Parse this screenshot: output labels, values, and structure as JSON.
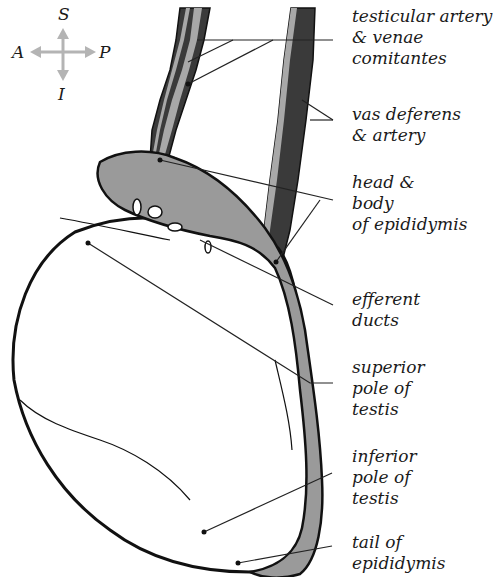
{
  "figure": {
    "colors": {
      "background": "#ffffff",
      "outline": "#111111",
      "epididymis_fill": "#9a9a9a",
      "dark_vessel": "#3a3a3a",
      "light_vessel": "#a8a8a8",
      "compass_arrow": "#b4b4b4",
      "leader_line": "#222222"
    }
  },
  "compass": {
    "superior": "S",
    "inferior": "I",
    "anterior": "A",
    "posterior": "P"
  },
  "labels": [
    {
      "id": "testicular-artery",
      "lines": [
        "testicular artery",
        "& venae",
        "comitantes"
      ]
    },
    {
      "id": "vas-deferens",
      "lines": [
        "vas deferens",
        "& artery"
      ]
    },
    {
      "id": "head-body-epididymis",
      "lines": [
        "head &",
        "body",
        "of epididymis"
      ]
    },
    {
      "id": "efferent-ducts",
      "lines": [
        "efferent",
        "ducts"
      ]
    },
    {
      "id": "superior-pole",
      "lines": [
        "superior",
        "pole of",
        "testis"
      ]
    },
    {
      "id": "inferior-pole",
      "lines": [
        "inferior",
        "pole of",
        "testis"
      ]
    },
    {
      "id": "tail-epididymis",
      "lines": [
        "tail of",
        "epididymis"
      ]
    }
  ]
}
